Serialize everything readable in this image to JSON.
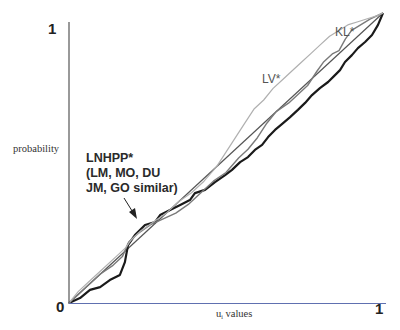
{
  "chart_data": {
    "type": "line",
    "title": "",
    "xlabel": "u_i values",
    "ylabel": "probability",
    "xlim": [
      0,
      1
    ],
    "ylim": [
      0,
      1
    ],
    "grid": false,
    "legend": "none (inline annotations)",
    "x_ticks": [
      "0",
      "1"
    ],
    "y_ticks": [
      "0",
      "1"
    ],
    "annotations": [
      {
        "text_lines": [
          "LNHPP*",
          "(LM, MO, DU",
          "JM, GO similar)"
        ],
        "arrow_to_series": "LNHPP",
        "position": [
          0.04,
          0.52
        ]
      },
      {
        "text": "LV*",
        "series": "LV",
        "position": [
          0.59,
          0.77
        ]
      },
      {
        "text": "KL*",
        "series": "KL",
        "position": [
          0.83,
          0.9
        ]
      }
    ],
    "series": [
      {
        "name": "diagonal reference",
        "color": "#555555",
        "width": 1.2,
        "x": [
          0,
          1
        ],
        "y": [
          0,
          1
        ]
      },
      {
        "name": "LNHPP",
        "color": "#1a1a1a",
        "width": 2.2,
        "x": [
          0,
          0.035,
          0.067,
          0.099,
          0.13,
          0.162,
          0.178,
          0.188,
          0.21,
          0.242,
          0.274,
          0.29,
          0.322,
          0.354,
          0.385,
          0.401,
          0.433,
          0.465,
          0.497,
          0.519,
          0.545,
          0.57,
          0.592,
          0.615,
          0.634,
          0.656,
          0.678,
          0.704,
          0.729,
          0.752,
          0.774,
          0.799,
          0.825,
          0.847,
          0.863,
          0.879,
          0.901,
          0.92,
          0.943,
          0.965,
          0.984,
          1.0
        ],
        "y": [
          0,
          0.017,
          0.045,
          0.055,
          0.079,
          0.097,
          0.141,
          0.2,
          0.234,
          0.269,
          0.279,
          0.303,
          0.321,
          0.338,
          0.355,
          0.379,
          0.39,
          0.417,
          0.441,
          0.459,
          0.486,
          0.503,
          0.528,
          0.545,
          0.572,
          0.597,
          0.617,
          0.641,
          0.666,
          0.69,
          0.717,
          0.741,
          0.762,
          0.786,
          0.803,
          0.831,
          0.855,
          0.879,
          0.9,
          0.924,
          0.959,
          1.0
        ]
      },
      {
        "name": "KL",
        "color": "#7a7a7a",
        "width": 1.4,
        "x": [
          0,
          0.03,
          0.06,
          0.1,
          0.14,
          0.17,
          0.19,
          0.22,
          0.26,
          0.3,
          0.34,
          0.38,
          0.42,
          0.46,
          0.5,
          0.54,
          0.57,
          0.6,
          0.63,
          0.66,
          0.7,
          0.73,
          0.76,
          0.79,
          0.81,
          0.84,
          0.86,
          0.88,
          0.9,
          0.93,
          0.96,
          1.0
        ],
        "y": [
          0,
          0.03,
          0.06,
          0.1,
          0.13,
          0.16,
          0.21,
          0.24,
          0.27,
          0.29,
          0.31,
          0.34,
          0.38,
          0.42,
          0.45,
          0.5,
          0.53,
          0.57,
          0.62,
          0.66,
          0.69,
          0.72,
          0.75,
          0.8,
          0.83,
          0.86,
          0.87,
          0.91,
          0.94,
          0.96,
          0.98,
          1.0
        ]
      },
      {
        "name": "LV",
        "color": "#b0b0b0",
        "width": 1.2,
        "x": [
          0,
          0.03,
          0.07,
          0.11,
          0.15,
          0.18,
          0.2,
          0.23,
          0.27,
          0.31,
          0.35,
          0.39,
          0.43,
          0.47,
          0.5,
          0.53,
          0.56,
          0.59,
          0.62,
          0.65,
          0.68,
          0.71,
          0.74,
          0.77,
          0.8,
          0.83,
          0.86,
          0.89,
          0.92,
          0.95,
          0.98,
          1.0
        ],
        "y": [
          0,
          0.04,
          0.08,
          0.12,
          0.16,
          0.19,
          0.22,
          0.25,
          0.28,
          0.31,
          0.35,
          0.38,
          0.42,
          0.47,
          0.52,
          0.57,
          0.62,
          0.67,
          0.7,
          0.74,
          0.77,
          0.8,
          0.83,
          0.86,
          0.89,
          0.92,
          0.94,
          0.96,
          0.97,
          0.98,
          0.99,
          1.0
        ]
      }
    ]
  },
  "labels": {
    "y_top": "1",
    "origin": "0",
    "x_right": "1",
    "ylabel": "probability",
    "xlabel_main": "u",
    "xlabel_sub": "i",
    "xlabel_rest": " values",
    "lnhpp_line1": "LNHPP*",
    "lnhpp_line2": "(LM, MO, DU",
    "lnhpp_line3": "JM, GO similar)",
    "lv": "LV*",
    "kl": "KL*"
  }
}
